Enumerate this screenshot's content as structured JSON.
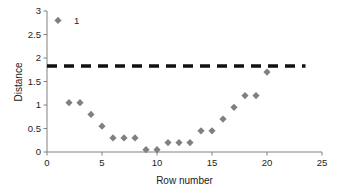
{
  "chart_data": {
    "type": "scatter",
    "title": "",
    "xlabel": "Row number",
    "ylabel": "Distance",
    "xlim": [
      0,
      25
    ],
    "ylim": [
      0,
      3
    ],
    "xticks": [
      "0",
      "5",
      "10",
      "15",
      "20",
      "25"
    ],
    "xtick_values": [
      0,
      5,
      10,
      15,
      20,
      25
    ],
    "yticks": [
      "0",
      "0.5",
      "1",
      "1.5",
      "2",
      "2.5",
      "3"
    ],
    "ytick_values": [
      0,
      0.5,
      1,
      1.5,
      2,
      2.5,
      3
    ],
    "grid": false,
    "legend": "none",
    "marker": "diamond",
    "marker_color": "#808080",
    "axis_color": "#808080",
    "text_color": "#232323",
    "series": [
      {
        "name": "Distance",
        "x": [
          1,
          2,
          3,
          4,
          5,
          6,
          7,
          8,
          9,
          10,
          11,
          12,
          13,
          14,
          15,
          16,
          17,
          18,
          19,
          20
        ],
        "values": [
          2.8,
          1.05,
          1.05,
          0.8,
          0.55,
          0.3,
          0.3,
          0.3,
          0.05,
          0.05,
          0.2,
          0.2,
          0.2,
          0.45,
          0.45,
          0.7,
          0.95,
          1.2,
          1.2,
          1.7
        ]
      }
    ],
    "annotations": [
      {
        "text": "1",
        "x": 1,
        "y": 2.8,
        "dx": 16,
        "dy": 0
      }
    ],
    "reference_line": {
      "type": "horizontal-dashed",
      "value": 1.83,
      "x_start": 0,
      "x_end": 23.5,
      "color": "#111111",
      "width": 3.4,
      "dash": "10 7"
    }
  }
}
